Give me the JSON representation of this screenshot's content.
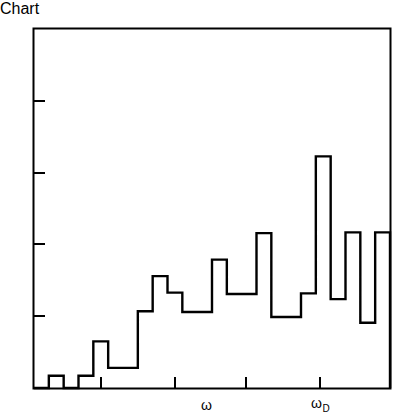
{
  "figure": {
    "background_color": "#ffffff",
    "line_color": "#000000"
  },
  "labels": {
    "ylabel": "Z (ω)",
    "xlabel": "ω",
    "xlabel_debye": "ω",
    "xlabel_debye_sub": "D"
  },
  "chart_data": {
    "type": "bar",
    "title": "",
    "subtitle": "",
    "xlabel": "ω",
    "ylabel": "Z (ω)",
    "grid": false,
    "legend": null,
    "style": "step-histogram",
    "xlim": [
      0,
      24
    ],
    "ylim": [
      0,
      5.04
    ],
    "x_tick_values": [
      4.5,
      9.5,
      14.25,
      19.25
    ],
    "x_tick_labels": [
      "",
      "",
      "",
      ""
    ],
    "y_tick_values": [
      1,
      2,
      3,
      4
    ],
    "y_tick_labels": [
      "",
      "",
      "",
      ""
    ],
    "annotations": [
      {
        "text": "ω",
        "x": 11.3,
        "y": -0.35
      },
      {
        "text": "ω_D",
        "x": 18.9,
        "y": -0.35
      }
    ],
    "bin_width": 1,
    "categories": [
      "1",
      "2",
      "3",
      "4",
      "5",
      "6",
      "7",
      "8",
      "9",
      "10",
      "11",
      "12",
      "13",
      "14",
      "15",
      "16",
      "17",
      "18",
      "19",
      "20",
      "21",
      "22",
      "23",
      "24"
    ],
    "bin_edges": [
      0,
      1,
      2,
      3,
      4,
      5,
      6,
      7,
      8,
      9,
      10,
      11,
      12,
      13,
      14,
      15,
      16,
      17,
      18,
      19,
      20,
      21,
      22,
      23,
      24
    ],
    "values": [
      0.0,
      0.17,
      0.0,
      0.17,
      0.65,
      0.28,
      0.28,
      1.07,
      1.56,
      1.33,
      1.06,
      1.06,
      1.79,
      1.31,
      1.31,
      2.16,
      0.99,
      0.99,
      1.32,
      3.23,
      1.24,
      2.17,
      0.91,
      2.17
    ],
    "extra_bars": [
      {
        "label": "peak",
        "position": 22.0,
        "value": 4.93
      },
      {
        "label": "tail",
        "position": 23.6,
        "value": 0.22
      }
    ]
  }
}
